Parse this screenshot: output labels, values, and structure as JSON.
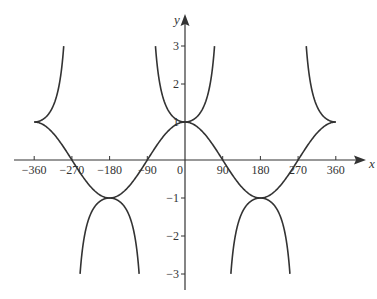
{
  "chart_data": {
    "type": "line",
    "title": "",
    "xlabel": "x",
    "ylabel": "y",
    "xlim": [
      -360,
      360
    ],
    "ylim": [
      -3,
      3
    ],
    "grid": false,
    "legend": null,
    "x_ticks": [
      -360,
      -270,
      -180,
      -90,
      0,
      90,
      180,
      270,
      360
    ],
    "x_tick_labels": [
      "−360",
      "−270",
      "−180",
      "−90",
      "0",
      "90",
      "180",
      "270",
      "360"
    ],
    "y_ticks": [
      3,
      2,
      1,
      -1,
      -2,
      -3
    ],
    "y_tick_labels": [
      "3",
      "2",
      "1",
      "−1",
      "−2",
      "−3"
    ],
    "series": [
      {
        "name": "y = cos x",
        "function": "cos",
        "x": [
          -360,
          -270,
          -180,
          -90,
          0,
          90,
          180,
          270,
          360
        ],
        "values": [
          1,
          0,
          -1,
          0,
          1,
          0,
          -1,
          0,
          1
        ]
      },
      {
        "name": "y = sec x",
        "function": "sec",
        "clipped_at": 3,
        "x": [
          -360,
          -180,
          0,
          180,
          360
        ],
        "values": [
          1,
          -1,
          1,
          -1,
          1
        ],
        "asymptotes": [
          -270,
          -90,
          90,
          270
        ]
      }
    ],
    "line_color": "#333333"
  },
  "axes": {
    "x_label": "x",
    "y_label": "y"
  }
}
